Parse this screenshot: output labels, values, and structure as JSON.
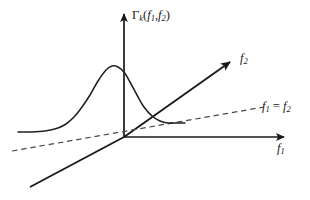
{
  "figure": {
    "title_label": "Γ",
    "vertical_axis_label": {
      "symbol": "Γ",
      "subscript": "k",
      "argument": "(f₁, f₂)",
      "full": "Γk(f1,f2)"
    },
    "axes": [
      {
        "name": "vertical-axis",
        "label": "Γk(f1,f2)",
        "direction": "up",
        "arrow": true
      },
      {
        "name": "f1-axis",
        "label": "f1",
        "direction": "right",
        "arrow": true
      },
      {
        "name": "f2-axis",
        "label": "f2",
        "direction": "up-right",
        "arrow": true
      },
      {
        "name": "depth-axis",
        "label": "",
        "direction": "down-left",
        "arrow": false
      }
    ],
    "dashed_line": {
      "name": "diagonal-f1-equals-f2",
      "label": "f1 = f2",
      "style": "dashed"
    },
    "curve": {
      "name": "peak-curve",
      "description": "single asymmetric peak rising from flat left baseline to a maximum near the vertical axis then decaying to a flat right tail",
      "style": "solid"
    },
    "colors": {
      "background": "#ffffff",
      "line": "#1a1a1a",
      "dashed": "#555555",
      "curve": "#222222"
    }
  },
  "chart_data": {
    "type": "line",
    "title": "Γk(f1,f2)",
    "xlabel": "f1",
    "ylabel": "Γk(f1,f2)",
    "zlabel": "f2",
    "grid": false,
    "legend": null,
    "annotations": [
      {
        "text": "f1 = f2",
        "kind": "dashed-diagonal-line"
      },
      {
        "text": "f2",
        "kind": "axis-arrow-label"
      },
      {
        "text": "f1",
        "kind": "axis-arrow-label"
      },
      {
        "text": "Γk(f1,f2)",
        "kind": "axis-arrow-label"
      }
    ],
    "series": [
      {
        "name": "bispectrum-ridge",
        "x": [
          18,
          30,
          45,
          58,
          66,
          74,
          82,
          90,
          98,
          106,
          112,
          118,
          124,
          130,
          137,
          144,
          152,
          160,
          168,
          176,
          185
        ],
        "y": [
          132,
          132,
          131,
          128,
          124,
          117,
          107,
          95,
          81,
          70,
          66,
          67,
          72,
          82,
          95,
          107,
          116,
          121,
          123,
          123,
          123
        ]
      }
    ],
    "xlim": [
      0,
      310
    ],
    "ylim": [
      200,
      0
    ]
  }
}
